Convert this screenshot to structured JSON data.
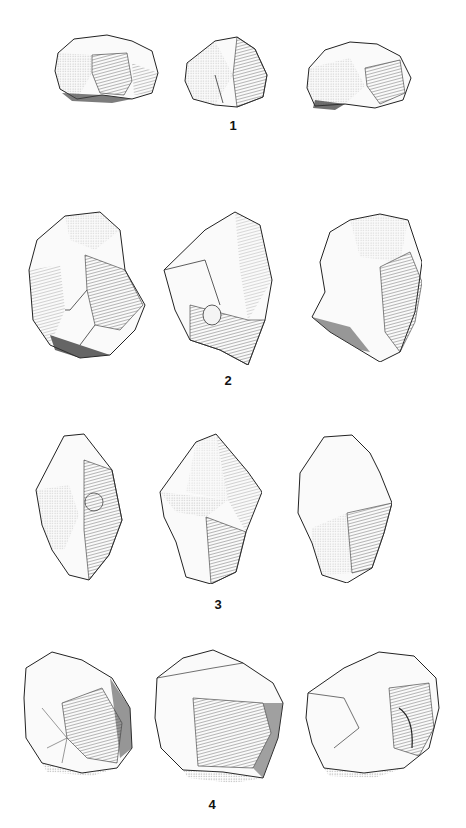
{
  "plate": {
    "description": "Lithic illustration plate: four stone cores, each drawn in three views",
    "colors": {
      "background": "#ffffff",
      "ink": "#1a1a1a",
      "shade_dark": "#3a3a3a",
      "shade_mid": "#8a8a8a",
      "shade_light": "#d8d8d8"
    }
  },
  "figures": [
    {
      "number": "1",
      "label_pos": {
        "x": 233,
        "y": 118
      },
      "views": [
        {
          "name": "view-a",
          "x": 52,
          "y": 33,
          "w": 110,
          "h": 72
        },
        {
          "name": "view-b",
          "x": 175,
          "y": 35,
          "w": 100,
          "h": 75
        },
        {
          "name": "view-c",
          "x": 305,
          "y": 38,
          "w": 110,
          "h": 73
        }
      ]
    },
    {
      "number": "2",
      "label_pos": {
        "x": 228,
        "y": 373
      },
      "views": [
        {
          "name": "view-a",
          "x": 25,
          "y": 210,
          "w": 122,
          "h": 150
        },
        {
          "name": "view-b",
          "x": 160,
          "y": 210,
          "w": 118,
          "h": 155
        },
        {
          "name": "view-c",
          "x": 310,
          "y": 212,
          "w": 112,
          "h": 150
        }
      ]
    },
    {
      "number": "3",
      "label_pos": {
        "x": 218,
        "y": 597
      },
      "views": [
        {
          "name": "view-a",
          "x": 34,
          "y": 430,
          "w": 90,
          "h": 152
        },
        {
          "name": "view-b",
          "x": 156,
          "y": 432,
          "w": 106,
          "h": 152
        },
        {
          "name": "view-c",
          "x": 292,
          "y": 433,
          "w": 100,
          "h": 150
        }
      ]
    },
    {
      "number": "4",
      "label_pos": {
        "x": 212,
        "y": 797
      },
      "views": [
        {
          "name": "view-a",
          "x": 22,
          "y": 648,
          "w": 112,
          "h": 128
        },
        {
          "name": "view-b",
          "x": 153,
          "y": 648,
          "w": 135,
          "h": 135
        },
        {
          "name": "view-c",
          "x": 304,
          "y": 648,
          "w": 137,
          "h": 130
        }
      ]
    }
  ]
}
